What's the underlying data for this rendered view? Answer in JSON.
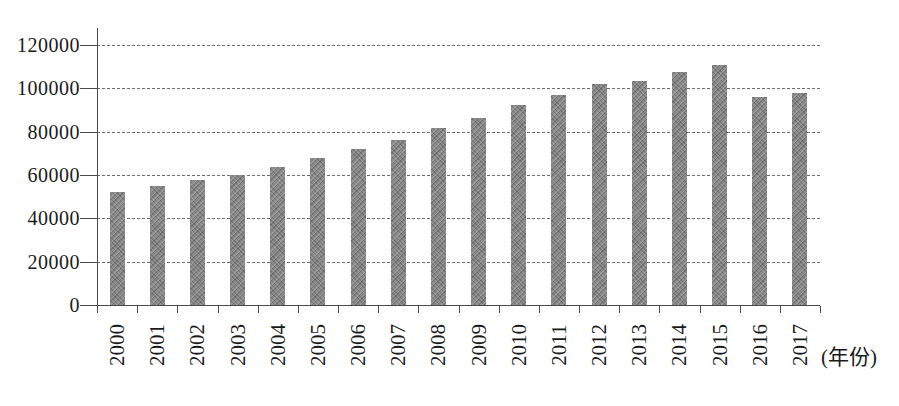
{
  "chart_data": {
    "type": "bar",
    "title": "",
    "xlabel": "(年份)",
    "ylabel": "",
    "categories": [
      "2000",
      "2001",
      "2002",
      "2003",
      "2004",
      "2005",
      "2006",
      "2007",
      "2008",
      "2009",
      "2010",
      "2011",
      "2012",
      "2013",
      "2014",
      "2015",
      "2016",
      "2017"
    ],
    "values": [
      52000,
      55000,
      57500,
      60000,
      63500,
      68000,
      72000,
      76000,
      81500,
      86500,
      92500,
      97000,
      102000,
      103500,
      107500,
      111000,
      96000,
      98000
    ],
    "ylim": [
      0,
      120000
    ],
    "yticks": [
      0,
      20000,
      40000,
      60000,
      80000,
      100000,
      120000
    ],
    "grid": "on",
    "grid_style": "dashed",
    "legend_position": "none",
    "bar_color": "#8e8e8e",
    "grid_color": "#6e6e6e",
    "axis_color": "#4a4a4a",
    "text_color": "#1a1a1a",
    "background_color": "#ffffff"
  }
}
